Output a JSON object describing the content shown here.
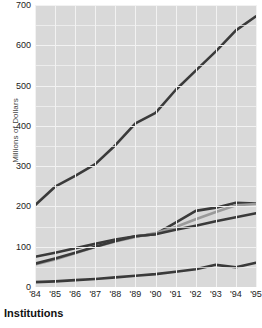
{
  "chart_data": {
    "type": "line",
    "title": "",
    "subtitle": "",
    "xlabel": "",
    "ylabel": "Millions of Dollars",
    "caption": "Institutions",
    "categories": [
      "'84",
      "'85",
      "'86",
      "'87",
      "'88",
      "'89",
      "'90",
      "'91",
      "'92",
      "'93",
      "'94",
      "'95"
    ],
    "x": [
      1984,
      1985,
      1986,
      1987,
      1988,
      1989,
      1990,
      1991,
      1992,
      1993,
      1994,
      1995
    ],
    "ylim": [
      0,
      700
    ],
    "yticks": [
      0,
      100,
      200,
      300,
      400,
      500,
      600,
      700
    ],
    "grid": true,
    "legend": "none",
    "plot_background": "#d9d9d9",
    "gridline_color": "#f2f2f2",
    "series": [
      {
        "name": "series-1-top",
        "color": "#3a3a3a",
        "width": 2.6,
        "values": [
          203,
          249,
          276,
          305,
          352,
          406,
          432,
          489,
          537,
          585,
          637,
          672
        ]
      },
      {
        "name": "series-2-upper-middle",
        "color": "#3a3a3a",
        "width": 2.6,
        "values": [
          75,
          85,
          96,
          107,
          118,
          126,
          131,
          160,
          189,
          197,
          209,
          207
        ]
      },
      {
        "name": "series-3-gray",
        "color": "#9a9a9a",
        "width": 2.6,
        "values": [
          56,
          68,
          84,
          99,
          113,
          124,
          134,
          149,
          168,
          186,
          203,
          206
        ]
      },
      {
        "name": "series-4-lower-middle",
        "color": "#3a3a3a",
        "width": 2.6,
        "values": [
          58,
          71,
          85,
          100,
          114,
          126,
          131,
          142,
          152,
          163,
          173,
          183
        ]
      },
      {
        "name": "series-5-bottom",
        "color": "#3a3a3a",
        "width": 2.6,
        "values": [
          12,
          14,
          17,
          20,
          24,
          28,
          32,
          38,
          44,
          55,
          49,
          60
        ]
      }
    ]
  }
}
